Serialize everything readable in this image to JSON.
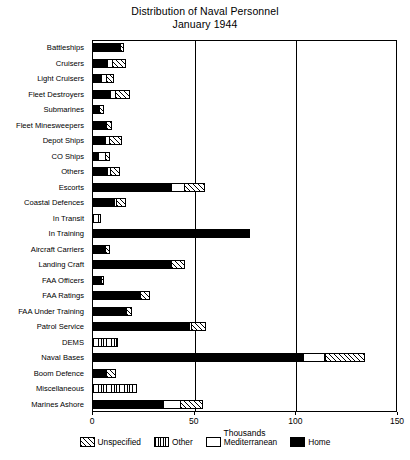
{
  "chart_data": {
    "type": "bar",
    "orientation": "horizontal",
    "stacked": true,
    "title": "Distribution of Naval Personnel",
    "subtitle": "January 1944",
    "xlabel": "Thousands",
    "ylabel": "",
    "xlim": [
      0,
      150
    ],
    "xticks": [
      0,
      50,
      100,
      150
    ],
    "xtick_labels": [
      "0",
      "50",
      "100",
      "150"
    ],
    "grid": true,
    "legend_position": "bottom",
    "categories": [
      "Battleships",
      "Cruisers",
      "Light Cruisers",
      "Fleet Destroyers",
      "Submarines",
      "Fleet Minesweepers",
      "Depot Ships",
      "CO Ships",
      "Others",
      "Escorts",
      "Coastal Defences",
      "In Transit",
      "In Training",
      "Aircraft Carriers",
      "Landing Craft",
      "FAA Officers",
      "FAA Ratings",
      "FAA Under Training",
      "Patrol Service",
      "DEMS",
      "Naval Bases",
      "Boom Defence",
      "Miscellaneous",
      "Marines Ashore"
    ],
    "series": [
      {
        "name": "Home",
        "key": "home",
        "pattern": "solid-black",
        "values": [
          14.0,
          7.5,
          4.5,
          9.0,
          3.5,
          6.5,
          6.5,
          3.0,
          7.5,
          39.0,
          11.0,
          0.0,
          77.0,
          6.5,
          39.0,
          4.0,
          24.0,
          17.0,
          48.0,
          0.0,
          104.0,
          7.0,
          0.0,
          35.0
        ]
      },
      {
        "name": "Mediterranean",
        "key": "mediterranean",
        "pattern": "white",
        "values": [
          0.0,
          3.0,
          3.0,
          3.0,
          0.0,
          1.0,
          2.5,
          4.0,
          2.0,
          7.0,
          1.5,
          0.0,
          0.0,
          0.0,
          0.0,
          0.5,
          0.0,
          0.0,
          1.5,
          0.0,
          11.0,
          0.0,
          0.0,
          9.0
        ]
      },
      {
        "name": "Other",
        "key": "other",
        "pattern": "vertical-lines",
        "values": [
          0.0,
          0.0,
          0.0,
          0.0,
          0.0,
          0.0,
          0.0,
          0.0,
          0.0,
          0.0,
          0.0,
          4.5,
          0.0,
          0.0,
          0.0,
          0.0,
          0.0,
          0.0,
          0.0,
          13.0,
          0.0,
          0.0,
          22.0,
          0.0
        ]
      },
      {
        "name": "Unspecified",
        "key": "unspecified",
        "pattern": "diagonal-hatch",
        "values": [
          2.0,
          7.0,
          4.0,
          7.5,
          2.5,
          3.0,
          6.5,
          2.5,
          5.0,
          10.0,
          5.0,
          0.0,
          1.0,
          2.5,
          7.0,
          1.5,
          5.0,
          3.0,
          7.0,
          0.0,
          20.0,
          5.0,
          0.0,
          11.0
        ]
      }
    ],
    "legend_entries": [
      {
        "label": "Unspecified",
        "key": "unspec"
      },
      {
        "label": "Other",
        "key": "other"
      },
      {
        "label": "Mediterranean",
        "key": "med"
      },
      {
        "label": "Home",
        "key": "home"
      }
    ]
  }
}
